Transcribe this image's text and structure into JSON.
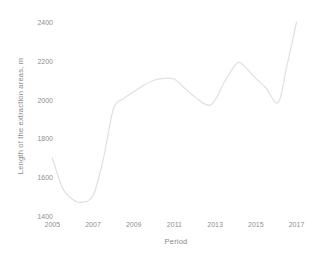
{
  "page": {
    "background": "#ffffff",
    "text_color": "#8a8a8a",
    "line_color": "#e0e0e0"
  },
  "chart_data": {
    "type": "line",
    "title": "",
    "xlabel": "Period",
    "ylabel": "Length of the extraction areas, m",
    "x_ticks": [
      "2005",
      "2007",
      "2009",
      "2011",
      "2013",
      "2015",
      "2017"
    ],
    "x_tick_values": [
      2005,
      2007,
      2009,
      2011,
      2013,
      2015,
      2017
    ],
    "y_ticks": [
      "1400",
      "1600",
      "1800",
      "2000",
      "2200",
      "2400"
    ],
    "y_tick_values": [
      1400,
      1600,
      1800,
      2000,
      2200,
      2400
    ],
    "xlim": [
      2005,
      2017
    ],
    "ylim": [
      1400,
      2400
    ],
    "grid": false,
    "legend": false,
    "line_color": "#e0e0e0",
    "series": [
      {
        "name": "extraction-area-length",
        "x": [
          2005,
          2005.5,
          2006,
          2006.4,
          2007,
          2007.5,
          2008,
          2008.5,
          2009,
          2009.5,
          2010,
          2010.5,
          2011,
          2011.5,
          2012,
          2012.8,
          2013.5,
          2014.1,
          2014.5,
          2015,
          2015.5,
          2016.1,
          2016.5,
          2017
        ],
        "y": [
          1700,
          1545,
          1485,
          1470,
          1505,
          1690,
          1950,
          2005,
          2040,
          2075,
          2100,
          2110,
          2105,
          2060,
          2015,
          1973,
          2100,
          2190,
          2165,
          2110,
          2060,
          1985,
          2160,
          2400
        ]
      }
    ]
  }
}
